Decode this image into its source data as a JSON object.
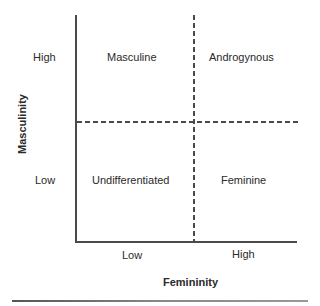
{
  "diagram": {
    "type": "2x2 quadrant diagram",
    "axes": {
      "x": {
        "title": "Femininity",
        "ticks": [
          "Low",
          "High"
        ]
      },
      "y": {
        "title": "Masculinity",
        "ticks": [
          "High",
          "Low"
        ]
      }
    },
    "quadrants": {
      "high_masc_low_fem": "Masculine",
      "high_masc_high_fem": "Androgynous",
      "low_masc_low_fem": "Undifferentiated",
      "low_masc_high_fem": "Feminine"
    },
    "colors": {
      "lines": "#4a4a4a",
      "text": "#2a2a2a",
      "background": "#ffffff"
    }
  }
}
